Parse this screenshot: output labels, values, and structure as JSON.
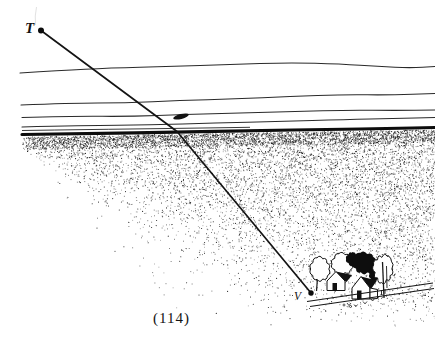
{
  "figure": {
    "point_t_label": "T",
    "point_v_label": "V",
    "caption": "(114)"
  },
  "colors": {
    "ink": "#1a1a1a",
    "paper": "#ffffff"
  }
}
